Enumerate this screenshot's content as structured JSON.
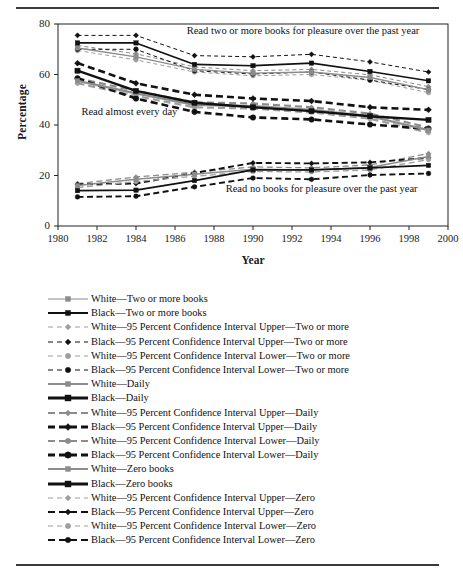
{
  "chart_data": {
    "type": "line",
    "title": "",
    "xlabel": "Year",
    "ylabel": "Percentage",
    "xlim": [
      1980,
      2000
    ],
    "ylim": [
      0,
      80
    ],
    "yticks": [
      0,
      20,
      40,
      60,
      80
    ],
    "xticks": [
      1980,
      1982,
      1984,
      1986,
      1988,
      1990,
      1992,
      1994,
      1996,
      1998,
      2000
    ],
    "grid": false,
    "legend_position": "below",
    "x": [
      1981,
      1984,
      1987,
      1990,
      1993,
      1996,
      1999
    ],
    "annotations": [
      {
        "text": "Read two or more books for pleasure over the past year",
        "x": 1986.6,
        "y": 76.0
      },
      {
        "text": "Read almost every day",
        "x": 1981.2,
        "y": 44.0
      },
      {
        "text": "Read no books for pleasure over the past year",
        "x": 1988.6,
        "y": 13.5
      }
    ],
    "series": [
      {
        "name": "White—Two or more books",
        "group": "two_or_more",
        "race": "White",
        "role": "point",
        "color": "#8c8c8c",
        "dash": "solid",
        "marker": "square",
        "values": [
          70.5,
          67.0,
          62.0,
          60.5,
          61.0,
          58.8,
          54.0
        ]
      },
      {
        "name": "Black—Two or more books",
        "group": "two_or_more",
        "race": "Black",
        "role": "point",
        "color": "#111111",
        "dash": "solid",
        "marker": "square",
        "values": [
          72.5,
          72.5,
          64.0,
          63.5,
          64.5,
          61.2,
          57.5
        ]
      },
      {
        "name": "White—95 Percent Confidence Interval Upper—Two or more",
        "group": "two_or_more",
        "race": "White",
        "role": "upper",
        "color": "#8c8c8c",
        "dash": "dashed-thin",
        "marker": "diamond",
        "values": [
          71.5,
          68.2,
          63.0,
          61.5,
          62.0,
          59.9,
          55.2
        ]
      },
      {
        "name": "Black—95 Percent Confidence Interval Upper—Two or more",
        "group": "two_or_more",
        "race": "Black",
        "role": "upper",
        "color": "#111111",
        "dash": "dashed-thin",
        "marker": "diamond",
        "values": [
          75.5,
          75.5,
          67.5,
          67.0,
          68.0,
          65.0,
          61.0
        ]
      },
      {
        "name": "White—95 Percent Confidence Interval Lower—Two or more",
        "group": "two_or_more",
        "race": "White",
        "role": "lower",
        "color": "#9e9e9e",
        "dash": "dashed-thin",
        "marker": "circle",
        "values": [
          69.5,
          65.8,
          61.0,
          59.5,
          60.0,
          57.7,
          52.8
        ]
      },
      {
        "name": "Black—95 Percent Confidence Interval Lower—Two or more",
        "group": "two_or_more",
        "race": "Black",
        "role": "lower",
        "color": "#111111",
        "dash": "dashed-thin",
        "marker": "circle",
        "values": [
          70.0,
          70.0,
          61.5,
          60.2,
          61.0,
          57.8,
          54.0
        ]
      },
      {
        "name": "White—Daily",
        "group": "daily",
        "race": "White",
        "role": "point",
        "color": "#8c8c8c",
        "dash": "solid",
        "marker": "square",
        "values": [
          57.5,
          52.5,
          48.0,
          47.5,
          46.0,
          43.5,
          38.0
        ]
      },
      {
        "name": "Black—Daily",
        "group": "daily",
        "race": "Black",
        "role": "point",
        "color": "#111111",
        "dash": "solid",
        "marker": "square",
        "values": [
          61.5,
          53.5,
          48.8,
          47.0,
          45.5,
          43.5,
          42.0
        ]
      },
      {
        "name": "White—95 Percent Confidence Interval Upper—Daily",
        "group": "daily",
        "race": "White",
        "role": "upper",
        "color": "#8c8c8c",
        "dash": "dashed-thick",
        "marker": "diamond",
        "values": [
          58.5,
          53.5,
          49.0,
          48.5,
          47.0,
          44.5,
          39.0
        ]
      },
      {
        "name": "Black—95 Percent Confidence Interval Upper—Daily",
        "group": "daily",
        "race": "Black",
        "role": "upper",
        "color": "#111111",
        "dash": "dashed-thick",
        "marker": "diamond",
        "values": [
          64.5,
          56.5,
          52.0,
          50.5,
          49.5,
          47.0,
          46.0
        ]
      },
      {
        "name": "White—95 Percent Confidence Interval Lower—Daily",
        "group": "daily",
        "race": "White",
        "role": "lower",
        "color": "#9e9e9e",
        "dash": "dashed-thick",
        "marker": "circle",
        "values": [
          56.5,
          51.5,
          47.0,
          46.5,
          45.0,
          42.5,
          37.0
        ]
      },
      {
        "name": "Black—95 Percent Confidence Interval Lower—Daily",
        "group": "daily",
        "race": "Black",
        "role": "lower",
        "color": "#111111",
        "dash": "dashed-thick",
        "marker": "circle",
        "values": [
          58.5,
          50.5,
          45.2,
          43.0,
          42.2,
          40.2,
          38.5
        ]
      },
      {
        "name": "White—Zero books",
        "group": "zero",
        "race": "White",
        "role": "point",
        "color": "#8c8c8c",
        "dash": "solid",
        "marker": "square",
        "values": [
          16.0,
          18.5,
          20.5,
          22.5,
          22.2,
          23.2,
          27.5
        ]
      },
      {
        "name": "Black—Zero books",
        "group": "zero",
        "race": "Black",
        "role": "point",
        "color": "#111111",
        "dash": "solid",
        "marker": "square",
        "values": [
          14.0,
          14.2,
          18.0,
          22.2,
          22.2,
          23.0,
          24.0
        ]
      },
      {
        "name": "White—95 Percent Confidence Interval Upper—Zero",
        "group": "zero",
        "race": "White",
        "role": "upper",
        "color": "#8c8c8c",
        "dash": "dashed-thin",
        "marker": "diamond",
        "values": [
          16.8,
          19.4,
          21.3,
          23.4,
          23.0,
          24.2,
          28.7
        ]
      },
      {
        "name": "Black—95 Percent Confidence Interval Upper—Zero",
        "group": "zero",
        "race": "Black",
        "role": "upper",
        "color": "#111111",
        "dash": "dashed-thin",
        "marker": "diamond",
        "values": [
          16.5,
          16.8,
          21.0,
          25.0,
          24.8,
          25.2,
          27.0
        ]
      },
      {
        "name": "White—95 Percent Confidence Interval Lower—Zero",
        "group": "zero",
        "race": "White",
        "role": "lower",
        "color": "#9e9e9e",
        "dash": "dashed-thin",
        "marker": "circle",
        "values": [
          15.2,
          17.6,
          19.7,
          21.6,
          21.4,
          22.2,
          26.3
        ]
      },
      {
        "name": "Black—95 Percent Confidence Interval Lower—Zero",
        "group": "zero",
        "race": "Black",
        "role": "lower",
        "color": "#111111",
        "dash": "dashed-thin",
        "marker": "circle",
        "values": [
          11.5,
          11.8,
          15.5,
          19.0,
          18.5,
          20.2,
          20.8
        ]
      }
    ]
  },
  "axis": {
    "y_title": "Percentage",
    "x_title": "Year",
    "y_ticks": [
      "0",
      "20",
      "40",
      "60",
      "80"
    ],
    "x_ticks": [
      "1980",
      "1982",
      "1984",
      "1986",
      "1988",
      "1990",
      "1992",
      "1994",
      "1996",
      "1998",
      "2000"
    ]
  },
  "annotations": {
    "two_or_more": "Read two or more books for pleasure over the past year",
    "daily": "Read almost every day",
    "zero": "Read no books for pleasure over the past year"
  },
  "legend": {
    "items": [
      {
        "label": "White—Two or more books",
        "color": "#8c8c8c",
        "dash": "solid",
        "marker": "square",
        "weight": "thin"
      },
      {
        "label": "Black—Two or more books",
        "color": "#111111",
        "dash": "solid",
        "marker": "square",
        "weight": "thick"
      },
      {
        "label": "White—95 Percent Confidence Interval Upper—Two or more",
        "color": "#9e9e9e",
        "dash": "dashed",
        "marker": "diamond",
        "weight": "thin"
      },
      {
        "label": "Black—95 Percent Confidence Interval Upper—Two or more",
        "color": "#111111",
        "dash": "dashed",
        "marker": "diamond",
        "weight": "thin"
      },
      {
        "label": "White—95 Percent Confidence Interval Lower—Two or more",
        "color": "#9e9e9e",
        "dash": "dashed",
        "marker": "circle",
        "weight": "thin"
      },
      {
        "label": "Black—95 Percent Confidence Interval Lower—Two or more",
        "color": "#111111",
        "dash": "dashed",
        "marker": "circle",
        "weight": "thin"
      },
      {
        "label": "White—Daily",
        "color": "#8c8c8c",
        "dash": "solid",
        "marker": "square",
        "weight": "thick"
      },
      {
        "label": "Black—Daily",
        "color": "#111111",
        "dash": "solid",
        "marker": "square",
        "weight": "thicker"
      },
      {
        "label": "White—95 Percent Confidence Interval Upper—Daily",
        "color": "#8c8c8c",
        "dash": "dashed",
        "marker": "diamond",
        "weight": "thick"
      },
      {
        "label": "Black—95 Percent Confidence Interval Upper—Daily",
        "color": "#111111",
        "dash": "dashed",
        "marker": "diamond",
        "weight": "thicker"
      },
      {
        "label": "White—95 Percent Confidence Interval Lower—Daily",
        "color": "#8c8c8c",
        "dash": "dashed",
        "marker": "circle",
        "weight": "thick"
      },
      {
        "label": "Black—95 Percent Confidence Interval Lower—Daily",
        "color": "#111111",
        "dash": "dashed",
        "marker": "circle",
        "weight": "thicker"
      },
      {
        "label": "White—Zero books",
        "color": "#8c8c8c",
        "dash": "solid",
        "marker": "square",
        "weight": "thick"
      },
      {
        "label": "Black—Zero books",
        "color": "#111111",
        "dash": "solid",
        "marker": "square",
        "weight": "thicker"
      },
      {
        "label": "White—95 Percent Confidence Interval Upper—Zero",
        "color": "#9e9e9e",
        "dash": "dashed",
        "marker": "diamond",
        "weight": "thin"
      },
      {
        "label": "Black—95 Percent Confidence Interval Upper—Zero",
        "color": "#111111",
        "dash": "dashed",
        "marker": "diamond",
        "weight": "thick"
      },
      {
        "label": "White—95 Percent Confidence Interval Lower—Zero",
        "color": "#9e9e9e",
        "dash": "dashed",
        "marker": "circle",
        "weight": "thin"
      },
      {
        "label": "Black—95 Percent Confidence Interval Lower—Zero",
        "color": "#111111",
        "dash": "dashed",
        "marker": "circle",
        "weight": "thick"
      }
    ]
  }
}
